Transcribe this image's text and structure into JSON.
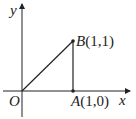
{
  "diagram": {
    "axes": {
      "x_label": "x",
      "y_label": "y",
      "origin_label": "O"
    },
    "points": [
      {
        "name": "A",
        "coords": "(1,0)"
      },
      {
        "name": "B",
        "coords": "(1,1)"
      }
    ],
    "segments": [
      "OB",
      "AB"
    ],
    "colors": {
      "stroke": "#222222",
      "background": "#ffffff"
    }
  }
}
